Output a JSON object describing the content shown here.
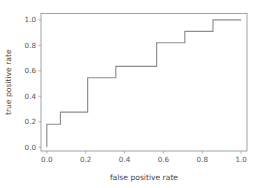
{
  "chart_data": {
    "type": "line",
    "title": "",
    "xlabel": "false positive rate",
    "ylabel": "true positive rate",
    "xlim": [
      -0.03,
      1.03
    ],
    "ylim": [
      -0.03,
      1.05
    ],
    "grid": false,
    "legend": null,
    "line_color": "#8d8d8d",
    "drawstyle": "steps-post",
    "xticks": [
      0.0,
      0.2,
      0.4,
      0.6,
      0.8,
      1.0
    ],
    "yticks": [
      0.0,
      0.2,
      0.4,
      0.6,
      0.8,
      1.0
    ],
    "xtick_labels": [
      "0.0",
      "0.2",
      "0.4",
      "0.6",
      "0.8",
      "1.0"
    ],
    "ytick_labels": [
      "0.0",
      "0.2",
      "0.4",
      "0.6",
      "0.8",
      "1.0"
    ],
    "series": [
      {
        "name": "roc-curve",
        "x": [
          0.0,
          0.0,
          0.07,
          0.07,
          0.21,
          0.21,
          0.355,
          0.355,
          0.565,
          0.565,
          0.71,
          0.71,
          0.855,
          0.855,
          1.0
        ],
        "y": [
          0.0,
          0.18,
          0.18,
          0.275,
          0.275,
          0.545,
          0.545,
          0.635,
          0.635,
          0.82,
          0.82,
          0.91,
          0.91,
          1.0,
          1.0
        ]
      }
    ]
  },
  "axes": {
    "x_title": "false positive rate",
    "y_title": "true positive rate"
  }
}
